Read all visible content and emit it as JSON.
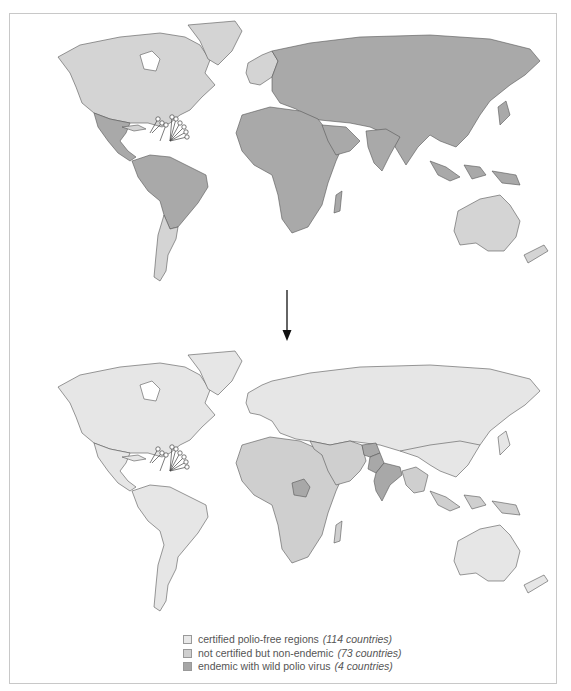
{
  "figure": {
    "arrow": "down-arrow"
  },
  "colors": {
    "certified": "#e6e6e6",
    "not_certified": "#cfcfcf",
    "endemic": "#a8a8a8",
    "top_light": "#d4d4d4",
    "top_dark": "#a9a9a9",
    "border": "#555555"
  },
  "maps": {
    "top": {
      "light_regions": [
        "North America",
        "Southern South America",
        "Northern & Western Europe (part)",
        "Australia & New Zealand"
      ],
      "dark_regions": [
        "Central America",
        "Northern South America",
        "Africa",
        "Eastern Europe & Russia",
        "Middle East",
        "Asia",
        "Southeast Asia"
      ]
    },
    "bottom": {
      "certified_regions": [
        "Americas",
        "Europe & Russia",
        "China",
        "East Asia",
        "Australia & New Zealand"
      ],
      "not_certified_regions": [
        "Africa",
        "Middle East",
        "Southeast Asia",
        "Central Asia"
      ],
      "endemic_regions": [
        "Nigeria",
        "Afghanistan",
        "Pakistan",
        "India"
      ]
    }
  },
  "legend": {
    "items": [
      {
        "label": "certified polio-free regions",
        "count": "(114 countries)",
        "color": "#e8e8e8"
      },
      {
        "label": "not certified but non-endemic",
        "count": "(73 countries)",
        "color": "#cfcfcf"
      },
      {
        "label": "endemic with wild polio virus",
        "count": "(4 countries)",
        "color": "#a6a6a6"
      }
    ]
  }
}
